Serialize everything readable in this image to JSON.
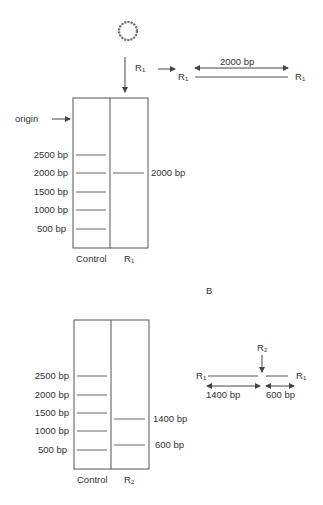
{
  "panel_a": {
    "plasmid_icon": "circular-plasmid",
    "enzyme_label": "R",
    "enzyme_sub": "1",
    "linear_fragment": {
      "left_site": "R",
      "left_site_sub": "1",
      "right_site": "R",
      "right_site_sub": "1",
      "length_label": "2000 bp"
    },
    "origin_label": "origin",
    "ladder": [
      "2500 bp",
      "2000 bp",
      "1500 bp",
      "1000 bp",
      "500 bp"
    ],
    "sample_band_label": "2000 bp",
    "lane_labels": [
      "Control",
      "R"
    ],
    "lane2_sub": "1"
  },
  "panel_b_label": "B",
  "panel_b": {
    "ladder": [
      "2500 bp",
      "2000 bp",
      "1500 bp",
      "1000 bp",
      "500 bp"
    ],
    "sample_band_labels": [
      "1400 bp",
      "600 bp"
    ],
    "lane_labels": [
      "Control",
      "R"
    ],
    "lane2_sub": "2",
    "map": {
      "cut_label": "R",
      "cut_sub": "2",
      "left_site": "R",
      "left_site_sub": "1",
      "right_site": "R",
      "right_site_sub": "1",
      "left_length": "1400 bp",
      "right_length": "600 bp"
    }
  },
  "colors": {
    "line": "#555555",
    "text": "#333333"
  }
}
